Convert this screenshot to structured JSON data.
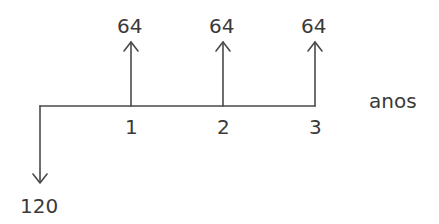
{
  "diagram": {
    "type": "cash-flow",
    "axis_label": "anos",
    "line_color": "#4a4a4a",
    "text_color": "#3a3a3a",
    "periods": [
      {
        "label": "1",
        "x": 131
      },
      {
        "label": "2",
        "x": 223
      },
      {
        "label": "3",
        "x": 315
      }
    ],
    "inflows": [
      {
        "period": "1",
        "value": "64"
      },
      {
        "period": "2",
        "value": "64"
      },
      {
        "period": "3",
        "value": "64"
      }
    ],
    "outflows": [
      {
        "period": "0",
        "value": "120"
      }
    ]
  }
}
